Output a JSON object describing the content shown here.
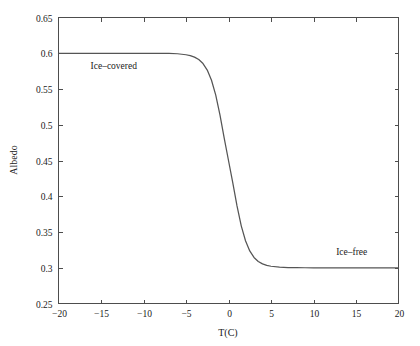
{
  "chart_data": {
    "type": "line",
    "title": "",
    "subtitle": "",
    "xlabel": "T(C)",
    "ylabel": "Albedo",
    "xlim": [
      -20,
      20
    ],
    "ylim": [
      0.25,
      0.65
    ],
    "xticks": [
      "-20",
      "-15",
      "-10",
      "-5",
      "0",
      "5",
      "10",
      "15",
      "20"
    ],
    "xtick_values": [
      -20,
      -15,
      -10,
      -5,
      0,
      5,
      10,
      15,
      20
    ],
    "yticks": [
      "0.25",
      "0.3",
      "0.35",
      "0.4",
      "0.45",
      "0.5",
      "0.55",
      "0.6",
      "0.65"
    ],
    "ytick_values": [
      0.25,
      0.3,
      0.35,
      0.4,
      0.45,
      0.5,
      0.55,
      0.6,
      0.65
    ],
    "grid": false,
    "legend": "none",
    "series": [
      {
        "name": "albedo",
        "color": "#555555",
        "description": "Smooth sigmoid (tanh) transition from high ice-covered albedo 0.6 to low ice-free albedo 0.3, centered at T = 0 C",
        "high_plateau": 0.6,
        "low_plateau": 0.3,
        "midpoint_t": 0,
        "midpoint_albedo": 0.45,
        "transition_width_c": 2.0,
        "x": [
          -20,
          -19,
          -18,
          -17,
          -16,
          -15,
          -14,
          -13,
          -12,
          -11,
          -10,
          -9,
          -8,
          -7,
          -6,
          -5,
          -4.5,
          -4,
          -3.5,
          -3,
          -2.5,
          -2,
          -1.5,
          -1,
          -0.5,
          0,
          0.5,
          1,
          1.5,
          2,
          2.5,
          3,
          3.5,
          4,
          4.5,
          5,
          6,
          7,
          8,
          9,
          10,
          11,
          12,
          13,
          14,
          15,
          16,
          17,
          18,
          19,
          20
        ],
        "values": [
          0.6,
          0.6,
          0.6,
          0.6,
          0.6,
          0.6,
          0.6,
          0.6,
          0.6,
          0.6,
          0.6,
          0.6,
          0.5999,
          0.5998,
          0.5993,
          0.5979,
          0.5966,
          0.5946,
          0.5912,
          0.5856,
          0.5765,
          0.5622,
          0.5414,
          0.5136,
          0.4808,
          0.45,
          0.4192,
          0.3864,
          0.3586,
          0.3378,
          0.3235,
          0.3144,
          0.3088,
          0.3054,
          0.3034,
          0.3021,
          0.3008,
          0.3002,
          0.3001,
          0.3,
          0.3,
          0.3,
          0.3,
          0.3,
          0.3,
          0.3,
          0.3,
          0.3,
          0.3,
          0.3,
          0.3
        ]
      }
    ],
    "annotations": [
      {
        "text": "Ice–covered",
        "x": -13.5,
        "y": 0.578
      },
      {
        "text": "Ice–free",
        "x": 14.5,
        "y": 0.318
      }
    ]
  },
  "axes": {
    "y_label": "Albedo",
    "x_label": "T(C)"
  }
}
